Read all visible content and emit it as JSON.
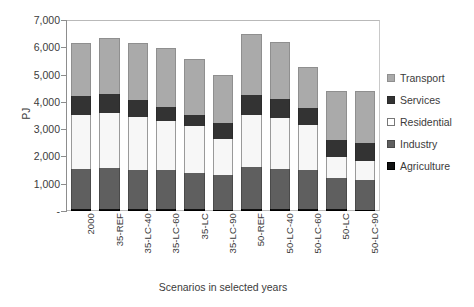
{
  "chart_data": {
    "type": "bar",
    "subtype": "stacked-column",
    "title": "",
    "xlabel": "Scenarios in selected years",
    "ylabel": "PJ",
    "ylim": [
      0,
      7000
    ],
    "yticks": [
      0,
      1000,
      2000,
      3000,
      4000,
      5000,
      6000,
      7000
    ],
    "ytick_labels": [
      "-",
      "1,000",
      "2,000",
      "3,000",
      "4,000",
      "5,000",
      "6,000",
      "7,000"
    ],
    "grid": false,
    "legend_position": "right",
    "categories": [
      "2000",
      "35-REF",
      "35-LC-40",
      "35-LC-60",
      "35-LC",
      "35-LC-90",
      "50-REF",
      "50-LC-40",
      "50-LC-60",
      "50-LC",
      "50-LC-90"
    ],
    "series": [
      {
        "name": "Agriculture",
        "color": "#111111",
        "values": [
          70,
          70,
          65,
          65,
          60,
          55,
          70,
          70,
          65,
          60,
          55
        ]
      },
      {
        "name": "Industry",
        "color": "#5f5f5f",
        "values": [
          1460,
          1510,
          1450,
          1430,
          1330,
          1275,
          1530,
          1470,
          1430,
          1140,
          1095
        ]
      },
      {
        "name": "Residential",
        "color": "#ffffff",
        "values": [
          1980,
          2000,
          1940,
          1790,
          1720,
          1300,
          1910,
          1870,
          1650,
          770,
          670
        ]
      },
      {
        "name": "Services",
        "color": "#333333",
        "values": [
          700,
          720,
          620,
          540,
          420,
          600,
          730,
          700,
          620,
          620,
          660
        ]
      },
      {
        "name": "Transport",
        "color": "#aaaaaa",
        "values": [
          1940,
          2050,
          2075,
          2135,
          2060,
          1760,
          2240,
          2090,
          1520,
          1810,
          1930
        ]
      }
    ],
    "totals": [
      6150,
      6350,
      6150,
      5960,
      5590,
      4990,
      6480,
      6200,
      5285,
      4400,
      4410
    ]
  },
  "legend": {
    "items": [
      {
        "label": "Transport",
        "swatch": "transport-swatch"
      },
      {
        "label": "Services",
        "swatch": "services-swatch"
      },
      {
        "label": "Residential",
        "swatch": "residential-swatch"
      },
      {
        "label": "Industry",
        "swatch": "industry-swatch"
      },
      {
        "label": "Agriculture",
        "swatch": "agriculture-swatch"
      }
    ]
  }
}
